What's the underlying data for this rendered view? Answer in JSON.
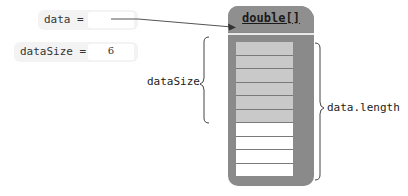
{
  "variables": [
    {
      "name": "data",
      "label": "data =",
      "value": ""
    },
    {
      "name": "dataSize",
      "label": "dataSize =",
      "value": "6"
    }
  ],
  "array": {
    "title": "double[]",
    "length": 10,
    "filled_count": 6,
    "cells": [
      "filled",
      "filled",
      "filled",
      "filled",
      "filled",
      "filled",
      "empty",
      "empty",
      "empty",
      "empty"
    ]
  },
  "brackets": {
    "left_label": "dataSize",
    "right_label": "data.length"
  },
  "colors": {
    "array_body": "#8a8a8a",
    "filled_cell": "#c9c9c9",
    "empty_cell": "#ffffff",
    "variable_box": "#f3f3f3"
  }
}
